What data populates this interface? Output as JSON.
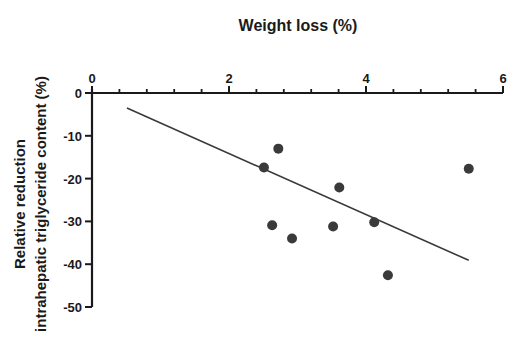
{
  "chart_data": {
    "type": "scatter",
    "title": "Weight loss (%)",
    "xlabel": "Weight loss (%)",
    "ylabel": "Relative reduction intrahepatic triglyceride content (%)",
    "ylabel_lines": [
      "Relative reduction",
      "intrahepatic triglyceride content (%)"
    ],
    "x_axis_position": "top",
    "xlim": [
      0,
      6
    ],
    "ylim": [
      -50,
      0
    ],
    "x_ticks": [
      0,
      2,
      4,
      6
    ],
    "x_tick_labels": [
      "0",
      "2",
      "4",
      "6"
    ],
    "x_minor_step": 0.4,
    "y_ticks": [
      0,
      -10,
      -20,
      -30,
      -40,
      -50
    ],
    "y_tick_labels": [
      "0",
      "-10",
      "-20",
      "-30",
      "-40",
      "-50"
    ],
    "grid": false,
    "legend": null,
    "series": [
      {
        "name": "Subjects",
        "type": "scatter",
        "color": "#3a3a3a",
        "points": [
          {
            "x": 2.51,
            "y": -17.4
          },
          {
            "x": 2.72,
            "y": -13.0
          },
          {
            "x": 2.63,
            "y": -30.9
          },
          {
            "x": 2.92,
            "y": -34.0
          },
          {
            "x": 3.52,
            "y": -31.2
          },
          {
            "x": 3.61,
            "y": -22.1
          },
          {
            "x": 4.12,
            "y": -30.2
          },
          {
            "x": 4.32,
            "y": -42.6
          },
          {
            "x": 5.5,
            "y": -17.7
          }
        ]
      },
      {
        "name": "Linear regression",
        "type": "line",
        "color": "#3a3a3a",
        "points": [
          {
            "x": 0.51,
            "y": -3.5
          },
          {
            "x": 5.5,
            "y": -39.1
          }
        ]
      }
    ]
  }
}
